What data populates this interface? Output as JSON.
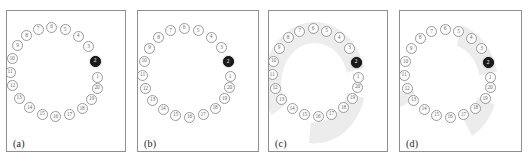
{
  "figure": {
    "title": "",
    "panel_count": 4,
    "node_count": 20,
    "highlight_node": "2",
    "highlight_color": "#1b1b1b",
    "node_fill_color": "#fdfdfd",
    "node_border_color": "#9a9a9a",
    "shade_color": "#ececec",
    "border_color": "#8f8f8f",
    "background_color": "#ffffff"
  },
  "chart_data": {
    "type": "scatter",
    "title": "",
    "xlabel": "",
    "ylabel": "",
    "panels": [
      {
        "label": "(a)",
        "nodes": [
          "1",
          "2",
          "3",
          "4",
          "5",
          "6",
          "7",
          "8",
          "9",
          "10",
          "11",
          "12",
          "13",
          "14",
          "15",
          "16",
          "17",
          "18",
          "19",
          "20"
        ],
        "highlighted": [
          "2"
        ],
        "shaded_regions": []
      },
      {
        "label": "(b)",
        "nodes": [
          "1",
          "2",
          "3",
          "4",
          "5",
          "6",
          "7",
          "8",
          "9",
          "10",
          "11",
          "12",
          "13",
          "14",
          "15",
          "16",
          "17",
          "18",
          "19",
          "20"
        ],
        "highlighted": [
          "2"
        ],
        "shaded_regions": []
      },
      {
        "label": "(c)",
        "nodes": [
          "1",
          "2",
          "3",
          "4",
          "5",
          "6",
          "7",
          "8",
          "9",
          "10",
          "11",
          "12",
          "13",
          "14",
          "15",
          "16",
          "17",
          "18",
          "19",
          "20"
        ],
        "highlighted": [
          "2"
        ],
        "shaded_regions": [
          {
            "name": "upper-sector",
            "covers": [
              "2",
              "3",
              "4",
              "5",
              "6",
              "7",
              "8"
            ]
          },
          {
            "name": "left-arc",
            "covers": [
              "9",
              "10",
              "11",
              "12",
              "13"
            ]
          },
          {
            "name": "lower-sector",
            "covers": [
              "14",
              "15",
              "16",
              "17",
              "18",
              "19",
              "20"
            ]
          }
        ]
      },
      {
        "label": "(d)",
        "nodes": [
          "1",
          "2",
          "3",
          "4",
          "5",
          "6",
          "7",
          "8",
          "9",
          "10",
          "11",
          "12",
          "13",
          "14",
          "15",
          "16",
          "17",
          "18",
          "19",
          "20"
        ],
        "highlighted": [
          "2"
        ],
        "shaded_regions": [
          {
            "name": "upper-right-band",
            "covers": [
              "2",
              "3",
              "4",
              "5"
            ]
          },
          {
            "name": "lower-right-band",
            "covers": [
              "18",
              "19",
              "20"
            ]
          },
          {
            "name": "left-patch",
            "covers": [
              "12"
            ]
          }
        ]
      }
    ]
  },
  "panels": [
    {
      "label": "(a)",
      "nodes": [
        {
          "id": "1",
          "x": 90.5,
          "y": 66.0
        },
        {
          "id": "2",
          "x": 88.0,
          "y": 50.0
        },
        {
          "id": "3",
          "x": 81.5,
          "y": 35.5
        },
        {
          "id": "4",
          "x": 71.0,
          "y": 25.0
        },
        {
          "id": "5",
          "x": 58.0,
          "y": 18.5
        },
        {
          "id": "6",
          "x": 44.5,
          "y": 16.0
        },
        {
          "id": "7",
          "x": 31.0,
          "y": 18.0
        },
        {
          "id": "8",
          "x": 19.5,
          "y": 24.5
        },
        {
          "id": "9",
          "x": 10.5,
          "y": 34.5
        },
        {
          "id": "10",
          "x": 5.0,
          "y": 47.5
        },
        {
          "id": "11",
          "x": 3.0,
          "y": 61.0
        },
        {
          "id": "12",
          "x": 5.5,
          "y": 74.5
        },
        {
          "id": "13",
          "x": 12.0,
          "y": 87.0
        },
        {
          "id": "14",
          "x": 22.5,
          "y": 96.5
        },
        {
          "id": "15",
          "x": 35.0,
          "y": 103.0
        },
        {
          "id": "16",
          "x": 48.5,
          "y": 105.5
        },
        {
          "id": "17",
          "x": 62.5,
          "y": 103.5
        },
        {
          "id": "18",
          "x": 75.0,
          "y": 97.5
        },
        {
          "id": "19",
          "x": 84.5,
          "y": 88.0
        },
        {
          "id": "20",
          "x": 90.0,
          "y": 77.0
        }
      ]
    },
    {
      "label": "(b)",
      "nodes": [
        {
          "id": "1",
          "x": 92.0,
          "y": 65.5
        },
        {
          "id": "2",
          "x": 90.0,
          "y": 50.5
        },
        {
          "id": "3",
          "x": 83.5,
          "y": 36.5
        },
        {
          "id": "4",
          "x": 73.0,
          "y": 26.0
        },
        {
          "id": "5",
          "x": 60.0,
          "y": 19.5
        },
        {
          "id": "6",
          "x": 46.0,
          "y": 17.0
        },
        {
          "id": "7",
          "x": 32.5,
          "y": 19.5
        },
        {
          "id": "8",
          "x": 20.5,
          "y": 26.5
        },
        {
          "id": "9",
          "x": 11.5,
          "y": 37.0
        },
        {
          "id": "10",
          "x": 6.0,
          "y": 50.0
        },
        {
          "id": "11",
          "x": 4.5,
          "y": 64.0
        },
        {
          "id": "12",
          "x": 7.5,
          "y": 77.5
        },
        {
          "id": "13",
          "x": 14.5,
          "y": 89.0
        },
        {
          "id": "14",
          "x": 25.0,
          "y": 98.0
        },
        {
          "id": "15",
          "x": 37.5,
          "y": 104.0
        },
        {
          "id": "16",
          "x": 51.5,
          "y": 106.0
        },
        {
          "id": "17",
          "x": 65.0,
          "y": 103.5
        },
        {
          "id": "18",
          "x": 77.0,
          "y": 97.0
        },
        {
          "id": "19",
          "x": 86.5,
          "y": 87.5
        },
        {
          "id": "20",
          "x": 91.5,
          "y": 76.5
        }
      ]
    },
    {
      "label": "(c)",
      "nodes": [
        {
          "id": "1",
          "x": 89.0,
          "y": 66.0
        },
        {
          "id": "2",
          "x": 87.0,
          "y": 51.0
        },
        {
          "id": "3",
          "x": 80.5,
          "y": 37.0
        },
        {
          "id": "4",
          "x": 70.0,
          "y": 26.5
        },
        {
          "id": "5",
          "x": 57.5,
          "y": 20.0
        },
        {
          "id": "6",
          "x": 44.0,
          "y": 17.5
        },
        {
          "id": "7",
          "x": 30.5,
          "y": 20.0
        },
        {
          "id": "8",
          "x": 19.0,
          "y": 26.5
        },
        {
          "id": "9",
          "x": 10.0,
          "y": 37.0
        },
        {
          "id": "10",
          "x": 4.5,
          "y": 50.0
        },
        {
          "id": "11",
          "x": 3.0,
          "y": 63.5
        },
        {
          "id": "12",
          "x": 6.0,
          "y": 77.0
        },
        {
          "id": "13",
          "x": 12.5,
          "y": 88.5
        },
        {
          "id": "14",
          "x": 23.0,
          "y": 97.5
        },
        {
          "id": "15",
          "x": 35.5,
          "y": 103.5
        },
        {
          "id": "16",
          "x": 49.0,
          "y": 105.5
        },
        {
          "id": "17",
          "x": 62.5,
          "y": 103.0
        },
        {
          "id": "18",
          "x": 74.5,
          "y": 96.5
        },
        {
          "id": "19",
          "x": 83.5,
          "y": 87.0
        },
        {
          "id": "20",
          "x": 88.5,
          "y": 76.0
        }
      ]
    },
    {
      "label": "(d)",
      "nodes": [
        {
          "id": "1",
          "x": 90.0,
          "y": 66.5
        },
        {
          "id": "2",
          "x": 88.0,
          "y": 51.5
        },
        {
          "id": "3",
          "x": 81.5,
          "y": 37.5
        },
        {
          "id": "4",
          "x": 71.0,
          "y": 27.0
        },
        {
          "id": "5",
          "x": 58.5,
          "y": 20.5
        },
        {
          "id": "6",
          "x": 45.0,
          "y": 18.0
        },
        {
          "id": "7",
          "x": 31.5,
          "y": 20.5
        },
        {
          "id": "8",
          "x": 20.0,
          "y": 27.0
        },
        {
          "id": "9",
          "x": 11.0,
          "y": 37.5
        },
        {
          "id": "10",
          "x": 5.5,
          "y": 50.5
        },
        {
          "id": "11",
          "x": 4.0,
          "y": 64.0
        },
        {
          "id": "12",
          "x": 7.0,
          "y": 77.5
        },
        {
          "id": "13",
          "x": 13.5,
          "y": 89.0
        },
        {
          "id": "14",
          "x": 24.0,
          "y": 98.0
        },
        {
          "id": "15",
          "x": 36.5,
          "y": 104.0
        },
        {
          "id": "16",
          "x": 50.0,
          "y": 106.0
        },
        {
          "id": "17",
          "x": 63.5,
          "y": 103.5
        },
        {
          "id": "18",
          "x": 75.5,
          "y": 97.0
        },
        {
          "id": "19",
          "x": 85.0,
          "y": 87.5
        },
        {
          "id": "20",
          "x": 90.0,
          "y": 76.5
        }
      ]
    }
  ]
}
